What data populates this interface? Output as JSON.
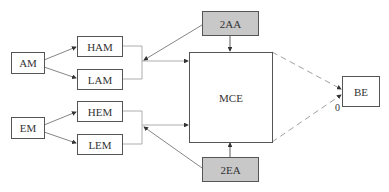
{
  "diagram": {
    "nodes": {
      "am": {
        "label": "AM"
      },
      "ham": {
        "label": "HAM"
      },
      "lam": {
        "label": "LAM"
      },
      "em": {
        "label": "EM"
      },
      "hem": {
        "label": "HEM"
      },
      "lem": {
        "label": "LEM"
      },
      "aa2": {
        "label": "2AA"
      },
      "mce": {
        "label": "MCE"
      },
      "ea2": {
        "label": "2EA"
      },
      "be": {
        "label": "BE"
      }
    },
    "edge_labels": {
      "zero": "0"
    },
    "colors": {
      "line": "#666666",
      "gray_fill": "#c8c8c8",
      "dashed": "#888888"
    }
  }
}
